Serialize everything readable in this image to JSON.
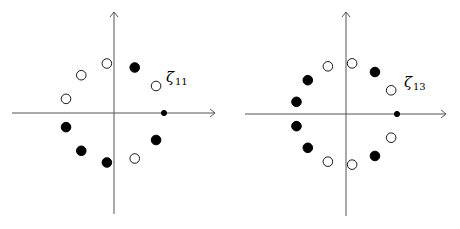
{
  "diagrams": [
    {
      "id": "left",
      "label": "ζ",
      "subscript": "11",
      "n": 11,
      "center": [
        114,
        113
      ],
      "radius": 50,
      "axis": {
        "x_from": 12,
        "x_to": 215,
        "y_from": 12,
        "y_to": 214
      },
      "label_pos": [
        166,
        82
      ],
      "points": [
        {
          "angle_deg": 0,
          "type": "small"
        },
        {
          "angle_deg": 32.7,
          "type": "open"
        },
        {
          "angle_deg": 65.5,
          "type": "filled"
        },
        {
          "angle_deg": 98.2,
          "type": "open"
        },
        {
          "angle_deg": 130.9,
          "type": "open"
        },
        {
          "angle_deg": 163.6,
          "type": "open"
        },
        {
          "angle_deg": 196.4,
          "type": "filled"
        },
        {
          "angle_deg": 229.1,
          "type": "filled"
        },
        {
          "angle_deg": 261.8,
          "type": "filled"
        },
        {
          "angle_deg": 294.5,
          "type": "open"
        },
        {
          "angle_deg": 327.3,
          "type": "filled"
        }
      ]
    },
    {
      "id": "right",
      "label": "ζ",
      "subscript": "13",
      "n": 13,
      "center": [
        346,
        114
      ],
      "radius": 51,
      "axis": {
        "x_from": 245,
        "x_to": 446,
        "y_from": 12,
        "y_to": 216
      },
      "label_pos": [
        404,
        87
      ],
      "points": [
        {
          "angle_deg": 0,
          "type": "small"
        },
        {
          "angle_deg": 27.7,
          "type": "open"
        },
        {
          "angle_deg": 55.4,
          "type": "filled"
        },
        {
          "angle_deg": 83.1,
          "type": "open"
        },
        {
          "angle_deg": 110.8,
          "type": "open"
        },
        {
          "angle_deg": 138.5,
          "type": "filled"
        },
        {
          "angle_deg": 166.2,
          "type": "filled"
        },
        {
          "angle_deg": 193.8,
          "type": "filled"
        },
        {
          "angle_deg": 221.5,
          "type": "filled"
        },
        {
          "angle_deg": 249.2,
          "type": "open"
        },
        {
          "angle_deg": 276.9,
          "type": "open"
        },
        {
          "angle_deg": 304.6,
          "type": "filled"
        },
        {
          "angle_deg": 332.3,
          "type": "open"
        }
      ]
    }
  ]
}
